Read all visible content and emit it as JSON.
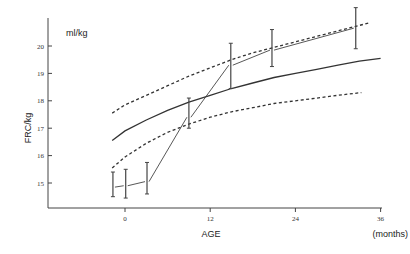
{
  "chart_data": {
    "type": "line",
    "title": "",
    "unit_annotation": "ml/kg",
    "xlabel": "AGE",
    "xunit": "(months)",
    "ylabel": "FRC/kg",
    "xlim": [
      -8,
      36
    ],
    "ylim": [
      14,
      21.5
    ],
    "xticks": [
      0,
      12,
      24,
      36
    ],
    "yticks": [
      15,
      16,
      17,
      18,
      19,
      20
    ],
    "grid": false,
    "legend": null,
    "series": [
      {
        "name": "reference mean",
        "style": "solid",
        "x": [
          -1.8,
          0,
          3,
          6,
          9,
          12,
          15,
          18,
          21,
          24,
          27,
          30,
          33,
          36
        ],
        "y": [
          16.55,
          16.9,
          17.3,
          17.65,
          17.95,
          18.2,
          18.45,
          18.65,
          18.85,
          19.0,
          19.15,
          19.3,
          19.45,
          19.55
        ]
      },
      {
        "name": "reference upper limit",
        "style": "dashed",
        "x": [
          -1.8,
          0,
          3,
          6,
          9,
          12,
          15,
          18,
          21,
          24,
          27,
          30,
          34.5
        ],
        "y": [
          17.55,
          17.85,
          18.2,
          18.55,
          18.9,
          19.2,
          19.5,
          19.75,
          19.95,
          20.15,
          20.35,
          20.55,
          20.85
        ]
      },
      {
        "name": "reference lower limit",
        "style": "dashed",
        "x": [
          -1.8,
          0,
          3,
          6,
          9,
          12,
          15,
          18,
          21,
          24,
          27,
          30,
          33.3
        ],
        "y": [
          15.55,
          15.95,
          16.45,
          16.85,
          17.15,
          17.4,
          17.6,
          17.75,
          17.9,
          18.0,
          18.1,
          18.2,
          18.3
        ]
      },
      {
        "name": "patient measurements (mean ± range)",
        "style": "thin-solid-with-error-bars",
        "x": [
          -1.7,
          0.1,
          3.1,
          9.0,
          14.9,
          20.7,
          32.5
        ],
        "y": [
          14.85,
          14.9,
          15.05,
          17.4,
          19.3,
          19.85,
          20.65
        ],
        "err_low": [
          14.5,
          14.45,
          14.6,
          17.0,
          18.45,
          19.25,
          19.9
        ],
        "err_high": [
          15.4,
          15.5,
          15.75,
          18.1,
          20.1,
          20.6,
          21.4
        ]
      }
    ]
  },
  "labels": {
    "unit": "ml/kg",
    "ylabel": "FRC/kg",
    "xlabel": "AGE",
    "xunit": "(months)"
  }
}
